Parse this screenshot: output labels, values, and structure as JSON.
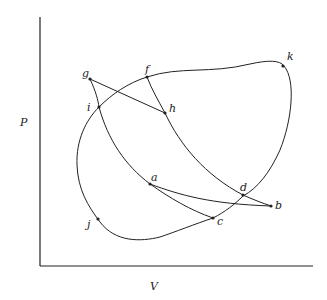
{
  "figure": {
    "axes": {
      "y_label": "P",
      "x_label": "V"
    },
    "points": {
      "a": "a",
      "b": "b",
      "c": "c",
      "d": "d",
      "f": "f",
      "g": "g",
      "h": "h",
      "i": "i",
      "j": "j",
      "k": "k"
    }
  }
}
